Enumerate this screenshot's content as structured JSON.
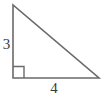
{
  "figure": {
    "kind": "right-triangle-diagram",
    "canvas": {
      "width": 104,
      "height": 98,
      "background": "#ffffff"
    },
    "stroke": {
      "color": "#6a6a6a",
      "width": 1.6
    },
    "text_color": "#3c3c3c",
    "vertices": {
      "top": {
        "x": 13,
        "y": 5
      },
      "right_angle": {
        "x": 13,
        "y": 78
      },
      "right": {
        "x": 99,
        "y": 78
      }
    },
    "right_angle_marker": {
      "x": 13,
      "y": 66,
      "size": 11,
      "at_vertex": "bottom-left"
    },
    "labels": {
      "vertical_leg": "3",
      "horizontal_leg": "4"
    }
  },
  "chart_data": {
    "type": "diagram",
    "title": "",
    "shape": "right triangle",
    "legs": [
      {
        "name": "vertical leg",
        "label": "3",
        "value": 3,
        "orientation": "vertical",
        "position": "left"
      },
      {
        "name": "horizontal leg",
        "label": "4",
        "value": 4,
        "orientation": "horizontal",
        "position": "bottom"
      }
    ],
    "hypotenuse": {
      "label": "",
      "value": 5,
      "shown": false
    },
    "right_angle_at": "bottom-left vertex",
    "annotations": [
      "3",
      "4"
    ]
  }
}
